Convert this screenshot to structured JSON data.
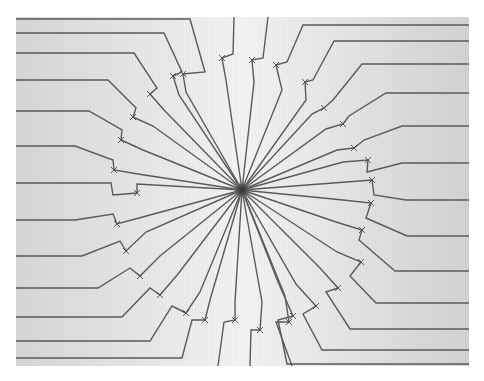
{
  "artwork": {
    "panel": {
      "x": 16,
      "y": 17,
      "w": 453,
      "h": 349,
      "bg_from": "#d8d8d8",
      "bg_mid": "#f2f2f2",
      "bg_to": "#d4d4d4"
    },
    "center": {
      "x": 242,
      "y": 190
    },
    "hub": {
      "r": 6,
      "color": "#333333"
    },
    "stroke_color": "#5a5a5a",
    "rays": [
      {
        "edge": [
          16,
          19
        ],
        "bend": [
          190,
          19
        ],
        "notch": [
          [
            205,
            72
          ],
          [
            183,
            74
          ],
          [
            186,
            92
          ]
        ]
      },
      {
        "edge": [
          16,
          33
        ],
        "bend": [
          164,
          33
        ],
        "notch": [
          [
            182,
            72
          ],
          [
            173,
            76
          ],
          [
            179,
            95
          ]
        ]
      },
      {
        "edge": [
          16,
          53
        ],
        "bend": [
          134,
          53
        ],
        "notch": [
          [
            157,
            88
          ],
          [
            150,
            94
          ],
          [
            164,
            110
          ]
        ]
      },
      {
        "edge": [
          16,
          80
        ],
        "bend": [
          108,
          80
        ],
        "notch": [
          [
            136,
            108
          ],
          [
            133,
            117
          ],
          [
            153,
            126
          ]
        ]
      },
      {
        "edge": [
          16,
          111
        ],
        "bend": [
          89,
          111
        ],
        "notch": [
          [
            122,
            130
          ],
          [
            121,
            140
          ],
          [
            143,
            150
          ]
        ]
      },
      {
        "edge": [
          16,
          146
        ],
        "bend": [
          75,
          146
        ],
        "notch": [
          [
            113,
            160
          ],
          [
            114,
            170
          ],
          [
            138,
            174
          ]
        ]
      },
      {
        "edge": [
          16,
          183
        ],
        "bend": [
          111,
          183
        ],
        "notch": [
          [
            113,
            195
          ],
          [
            137,
            193
          ],
          [
            137,
            184
          ]
        ]
      },
      {
        "edge": [
          16,
          220
        ],
        "bend": [
          75,
          220
        ],
        "notch": [
          [
            113,
            214
          ],
          [
            117,
            224
          ],
          [
            139,
            218
          ]
        ]
      },
      {
        "edge": [
          16,
          256
        ],
        "bend": [
          82,
          256
        ],
        "notch": [
          [
            120,
            241
          ],
          [
            126,
            251
          ],
          [
            146,
            232
          ]
        ]
      },
      {
        "edge": [
          16,
          288
        ],
        "bend": [
          98,
          288
        ],
        "notch": [
          [
            130,
            268
          ],
          [
            140,
            276
          ],
          [
            160,
            256
          ]
        ]
      },
      {
        "edge": [
          16,
          317
        ],
        "bend": [
          122,
          317
        ],
        "notch": [
          [
            150,
            288
          ],
          [
            160,
            295
          ],
          [
            178,
            274
          ]
        ]
      },
      {
        "edge": [
          16,
          341
        ],
        "bend": [
          150,
          341
        ],
        "notch": [
          [
            172,
            306
          ],
          [
            186,
            313
          ],
          [
            200,
            292
          ]
        ]
      },
      {
        "edge": [
          16,
          358
        ],
        "bend": [
          182,
          358
        ],
        "notch": [
          [
            192,
            320
          ],
          [
            205,
            320
          ],
          [
            210,
            300
          ]
        ]
      },
      {
        "edge": [
          218,
          366
        ],
        "bend": [
          218,
          366
        ],
        "notch": [
          [
            224,
            322
          ],
          [
            235,
            320
          ],
          [
            235,
            302
          ]
        ]
      },
      {
        "edge": [
          250,
          366
        ],
        "bend": [
          250,
          366
        ],
        "notch": [
          [
            251,
            330
          ],
          [
            260,
            330
          ],
          [
            262,
            302
          ]
        ]
      },
      {
        "edge": [
          292,
          366
        ],
        "bend": [
          292,
          366
        ],
        "notch": [
          [
            276,
            322
          ],
          [
            289,
            322
          ],
          [
            285,
            296
          ]
        ]
      },
      {
        "edge": [
          469,
          364
        ],
        "bend": [
          287,
          364
        ],
        "notch": [
          [
            278,
            320
          ],
          [
            293,
            316
          ],
          [
            278,
            282
          ]
        ]
      },
      {
        "edge": [
          469,
          350
        ],
        "bend": [
          322,
          350
        ],
        "notch": [
          [
            303,
            314
          ],
          [
            316,
            306
          ],
          [
            296,
            284
          ]
        ]
      },
      {
        "edge": [
          469,
          329
        ],
        "bend": [
          350,
          329
        ],
        "notch": [
          [
            326,
            292
          ],
          [
            338,
            288
          ],
          [
            320,
            268
          ]
        ]
      },
      {
        "edge": [
          469,
          303
        ],
        "bend": [
          376,
          303
        ],
        "notch": [
          [
            350,
            276
          ],
          [
            361,
            262
          ],
          [
            337,
            252
          ]
        ]
      },
      {
        "edge": [
          469,
          271
        ],
        "bend": [
          395,
          271
        ],
        "notch": [
          [
            359,
            240
          ],
          [
            362,
            230
          ],
          [
            336,
            222
          ]
        ]
      },
      {
        "edge": [
          469,
          236
        ],
        "bend": [
          407,
          236
        ],
        "notch": [
          [
            366,
            218
          ],
          [
            371,
            203
          ],
          [
            343,
            200
          ]
        ]
      },
      {
        "edge": [
          469,
          200
        ],
        "bend": [
          406,
          200
        ],
        "notch": [
          [
            374,
            195
          ],
          [
            372,
            180
          ],
          [
            346,
            182
          ]
        ]
      },
      {
        "edge": [
          469,
          163
        ],
        "bend": [
          402,
          163
        ],
        "notch": [
          [
            367,
            172
          ],
          [
            368,
            160
          ],
          [
            343,
            162
          ]
        ]
      },
      {
        "edge": [
          469,
          126
        ],
        "bend": [
          402,
          126
        ],
        "notch": [
          [
            364,
            140
          ],
          [
            354,
            148
          ],
          [
            337,
            150
          ]
        ]
      },
      {
        "edge": [
          469,
          93
        ],
        "bend": [
          386,
          93
        ],
        "notch": [
          [
            349,
            116
          ],
          [
            343,
            124
          ],
          [
            326,
            129
          ]
        ]
      },
      {
        "edge": [
          469,
          64
        ],
        "bend": [
          362,
          64
        ],
        "notch": [
          [
            333,
            100
          ],
          [
            324,
            108
          ],
          [
            312,
            114
          ]
        ]
      },
      {
        "edge": [
          469,
          41
        ],
        "bend": [
          334,
          41
        ],
        "notch": [
          [
            313,
            80
          ],
          [
            305,
            82
          ],
          [
            306,
            100
          ]
        ]
      },
      {
        "edge": [
          469,
          25
        ],
        "bend": [
          303,
          25
        ],
        "notch": [
          [
            287,
            62
          ],
          [
            276,
            65
          ],
          [
            282,
            90
          ]
        ]
      },
      {
        "edge": [
          268,
          17
        ],
        "bend": [
          268,
          17
        ],
        "notch": [
          [
            263,
            58
          ],
          [
            252,
            60
          ],
          [
            254,
            82
          ]
        ]
      },
      {
        "edge": [
          234,
          17
        ],
        "bend": [
          234,
          17
        ],
        "notch": [
          [
            233,
            54
          ],
          [
            222,
            58
          ],
          [
            226,
            80
          ]
        ]
      }
    ]
  }
}
